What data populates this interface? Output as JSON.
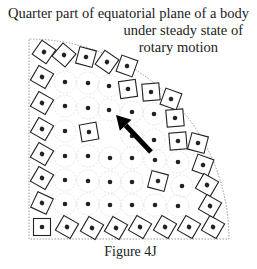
{
  "title": {
    "line1": "Quarter part of equatorial plane of a body",
    "line2": "under steady state of",
    "line3": "rotary motion"
  },
  "caption": "Figure 4J",
  "colors": {
    "ink": "#222222",
    "frame": "#999999",
    "faint_circle": "#e6e6e6"
  },
  "diagram": {
    "origin": [
      29,
      239
    ],
    "radius": 200,
    "boundary_squares": [
      {
        "x": 42,
        "y": 227,
        "r": 0
      },
      {
        "x": 67,
        "y": 227,
        "r": 30
      },
      {
        "x": 92,
        "y": 228,
        "r": 30
      },
      {
        "x": 116,
        "y": 228,
        "r": 30
      },
      {
        "x": 140,
        "y": 227,
        "r": 30
      },
      {
        "x": 165,
        "y": 227,
        "r": 30
      },
      {
        "x": 189,
        "y": 227,
        "r": 30
      },
      {
        "x": 213,
        "y": 227,
        "r": 30
      },
      {
        "x": 42,
        "y": 203,
        "r": 25
      },
      {
        "x": 42,
        "y": 178,
        "r": 30
      },
      {
        "x": 42,
        "y": 154,
        "r": 30
      },
      {
        "x": 42,
        "y": 129,
        "r": 30
      },
      {
        "x": 42,
        "y": 103,
        "r": 30
      },
      {
        "x": 42,
        "y": 77,
        "r": 30
      },
      {
        "x": 44,
        "y": 52,
        "r": 35
      },
      {
        "x": 64,
        "y": 55,
        "r": 40
      },
      {
        "x": 86,
        "y": 57,
        "r": 15
      },
      {
        "x": 107,
        "y": 62,
        "r": 35
      },
      {
        "x": 127,
        "y": 66,
        "r": 20
      },
      {
        "x": 128,
        "y": 89,
        "r": -8
      },
      {
        "x": 151,
        "y": 92,
        "r": -5
      },
      {
        "x": 171,
        "y": 99,
        "r": 20
      },
      {
        "x": 175,
        "y": 118,
        "r": -5
      },
      {
        "x": 178,
        "y": 141,
        "r": -5
      },
      {
        "x": 198,
        "y": 143,
        "r": 15
      },
      {
        "x": 203,
        "y": 165,
        "r": 20
      },
      {
        "x": 207,
        "y": 185,
        "r": 30
      },
      {
        "x": 210,
        "y": 206,
        "r": 30
      },
      {
        "x": 89,
        "y": 132,
        "r": -10
      },
      {
        "x": 158,
        "y": 181,
        "r": 15
      }
    ],
    "interior_dots": [
      [
        65,
        82
      ],
      [
        88,
        83
      ],
      [
        109,
        86
      ],
      [
        65,
        106
      ],
      [
        88,
        108
      ],
      [
        109,
        110
      ],
      [
        132,
        112
      ],
      [
        154,
        114
      ],
      [
        65,
        131
      ],
      [
        132,
        136
      ],
      [
        154,
        140
      ],
      [
        65,
        156
      ],
      [
        88,
        156
      ],
      [
        110,
        158
      ],
      [
        132,
        158
      ],
      [
        155,
        160
      ],
      [
        178,
        162
      ],
      [
        65,
        180
      ],
      [
        88,
        181
      ],
      [
        110,
        182
      ],
      [
        132,
        182
      ],
      [
        182,
        186
      ],
      [
        65,
        204
      ],
      [
        88,
        204
      ],
      [
        110,
        205
      ],
      [
        132,
        205
      ],
      [
        155,
        205
      ],
      [
        178,
        206
      ]
    ],
    "arrow": {
      "tail": [
        151,
        152
      ],
      "tip": [
        116,
        115
      ]
    }
  }
}
